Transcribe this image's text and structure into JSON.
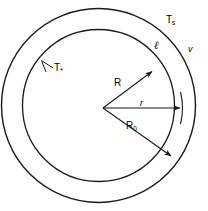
{
  "figure": {
    "type": "scientific-diagram",
    "background_color": "#ffffff",
    "stroke_color": "#1a1a1a",
    "geometry": {
      "center_x": 98.5,
      "center_y": 105.5,
      "outer_radius": 97,
      "inner_radius": 76,
      "outer_circle_label": "outer-boundary",
      "inner_circle_label": "inner-boundary"
    },
    "labels": {
      "temperature_outer": {
        "symbol": "T",
        "subscript": "s"
      },
      "temperature_inner": {
        "symbol": "T",
        "subscript": "*"
      },
      "phase_liquid": "ℓ",
      "phase_vapor": "v",
      "radius_inner": "R",
      "radius_variable": "r",
      "radius_outer": {
        "symbol": "R",
        "subscript": "0"
      }
    },
    "arrows": [
      {
        "name": "radius-R-arrow",
        "label": "R",
        "from": [
          103,
          108
        ],
        "to": [
          154,
          70
        ]
      },
      {
        "name": "radius-r-arrow",
        "label": "r",
        "from": [
          103,
          108
        ],
        "to": [
          183,
          108
        ]
      },
      {
        "name": "radius-R0-arrow",
        "label": "R0",
        "from": [
          103,
          108
        ],
        "to": [
          173,
          158
        ]
      }
    ],
    "leaders": [
      {
        "name": "t-star-leader",
        "from": [
          52,
          68
        ],
        "to": [
          40,
          61
        ]
      }
    ]
  }
}
